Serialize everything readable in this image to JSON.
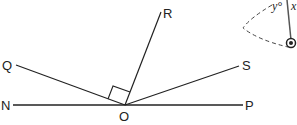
{
  "diagram": {
    "labels": {
      "N": "N",
      "O": "O",
      "P": "P",
      "Q": "Q",
      "R": "R",
      "S": "S"
    },
    "inset": {
      "angle_label": "y°",
      "var_label": "x"
    },
    "right_angle_marker": "QOR",
    "colors": {
      "line": "#222222",
      "background": "#ffffff"
    }
  }
}
